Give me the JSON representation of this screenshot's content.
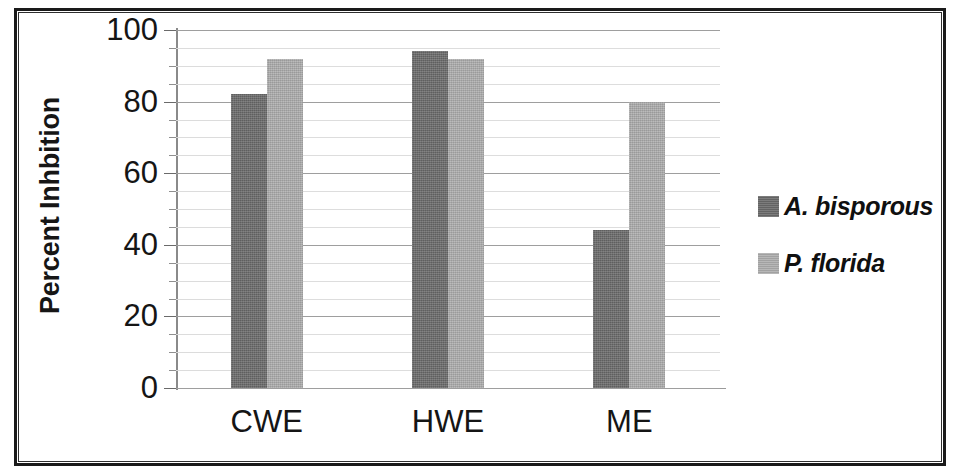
{
  "chart_data": {
    "type": "bar",
    "title": "",
    "subtitle": "",
    "xlabel": "",
    "ylabel": "Percent Inhbition",
    "categories": [
      "CWE",
      "HWE",
      "ME"
    ],
    "series": [
      {
        "name": "A. bisporous",
        "values": [
          82,
          94,
          44
        ],
        "color": "#6a6a6a"
      },
      {
        "name": "P. florida",
        "values": [
          92,
          92,
          80
        ],
        "color": "#adadad"
      }
    ],
    "ylim": [
      0,
      100
    ],
    "ytick_labels": [
      "0",
      "20",
      "40",
      "60",
      "80",
      "100"
    ],
    "ytick_values": [
      0,
      20,
      40,
      60,
      80,
      100
    ],
    "ytick_step": 20,
    "minor_gridline_step": 5,
    "grid": true,
    "grid_axis": "y",
    "legend_position": "right",
    "legend": [
      {
        "label": "A. bisporous",
        "swatch": "#6a6a6a"
      },
      {
        "label": "P. florida",
        "swatch": "#adadad"
      }
    ]
  },
  "colors": {
    "series_1": "#6a6a6a",
    "series_2": "#adadad",
    "gridline": "#c9c9c9",
    "axis": "#8a8a8a",
    "text": "#151515",
    "frame": "#1a1a1a",
    "background": "#ffffff"
  }
}
